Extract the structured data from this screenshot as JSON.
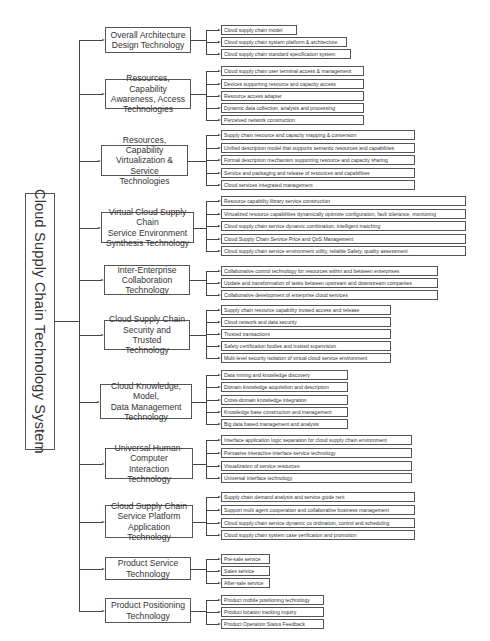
{
  "diagram": {
    "title": "Cloud Supply Chain Technology System",
    "categories": [
      {
        "label": "Overall Architecture Design Technology",
        "lines": [
          "Overall Architecture",
          "Design Technology"
        ],
        "items": [
          "Cloud supply chain model",
          "Cloud supply chain system platform & architecture",
          "Cloud supply chain standard specification system"
        ]
      },
      {
        "label": "Resources, Capability Awareness, Access Technologies",
        "lines": [
          "Resources, Capability",
          "Awareness, Access",
          "Technologies"
        ],
        "items": [
          "Cloud supply chain user terminal access & management",
          "Devices supporting resource and capacity access",
          "Resource access adapter",
          "Dynamic data collection, analysis and processing",
          "Perceived network construction"
        ]
      },
      {
        "label": "Resources, Capability Virtualization & Service Technologies",
        "lines": [
          "Resources, Capability",
          "Virtualization & Service",
          "Technologies"
        ],
        "items": [
          "Supply chain resource and capacity mapping & conversion",
          "Unified description model that supports semantic resources and capabilities",
          "Formal description mechanism supporting resource and capacity sharing",
          "Service and packaging and release of resources and capabilities",
          "Cloud services integrated management"
        ]
      },
      {
        "label": "Virtual Cloud Supply Chain Service Environment Synthesis Technology",
        "lines": [
          "Virtual Cloud Supply Chain",
          "Service Environment",
          "Synthesis Technology"
        ],
        "items": [
          "Resource capability library service construction",
          "Virtualized resource capabilities dynamically optimize configuration, fault tolerance, monitoring",
          "Cloud supply chain service dynamic combination, intelligent matching",
          "Cloud Supply Chain Service Price and QoS Management",
          "Cloud supply chain service environment utility, reliable Safety, quality assessment"
        ]
      },
      {
        "label": "Inter-Enterprise Collaboration Technology",
        "lines": [
          "Inter-Enterprise",
          "Collaboration",
          "Technology"
        ],
        "items": [
          "Collaborative control technology for resources within and between enterprises",
          "Update and transformation of tasks between upstream and downstream companies",
          "Collaborative development of enterprise cloud services"
        ]
      },
      {
        "label": "Cloud Supply Chain Security and Trusted Technology",
        "lines": [
          "Cloud Supply Chain",
          "Security and Trusted",
          "Technology"
        ],
        "items": [
          "Supply chain resource capability trusted access and release",
          "Cloud network and data security",
          "Trusted transactions",
          "Safety certification bodies and trusted supervision",
          "Multi-level security isolation of virtual cloud service environment"
        ]
      },
      {
        "label": "Cloud Knowledge, Model, Data Management Technology",
        "lines": [
          "Cloud Knowledge, Model,",
          "Data Management",
          "Technology"
        ],
        "items": [
          "Data mining and knowledge discovery",
          "Domain knowledge acquisition and description",
          "Cross-domain knowledge integration",
          "Knowledge base construction and management",
          "Big data based management and analysis"
        ]
      },
      {
        "label": "Universal Human-Computer Interaction Technology",
        "lines": [
          "Universal Human-",
          "Computer Interaction",
          "Technology"
        ],
        "items": [
          "Interface application logic separation for cloud supply chain environment",
          "Pervasive interactive interface service technology",
          "Visualization of service resources",
          "Universal interface technology"
        ]
      },
      {
        "label": "Cloud Supply Chain Service Platform Application Technology",
        "lines": [
          "Cloud Supply Chain",
          "Service Platform",
          "Application Technology"
        ],
        "items": [
          "Supply chain demand analysis and service guide rent",
          "Support multi agent cooperation and collaborative business management",
          "Cloud supply chain service dynamic co ordination, control and scheduling",
          "Cloud supply chain system case verification and promotion"
        ]
      },
      {
        "label": "Product Service Technology",
        "lines": [
          "Product Service",
          "Technology"
        ],
        "items": [
          "Pre-sale service",
          "Sales service",
          "After-sale service"
        ]
      },
      {
        "label": "Product Positioning Technology",
        "lines": [
          "Product Positioning",
          "Technology"
        ],
        "items": [
          "Product mobile positioning technology",
          "Product location tracking inquiry",
          "Product Operation Status Feedback"
        ]
      }
    ]
  }
}
